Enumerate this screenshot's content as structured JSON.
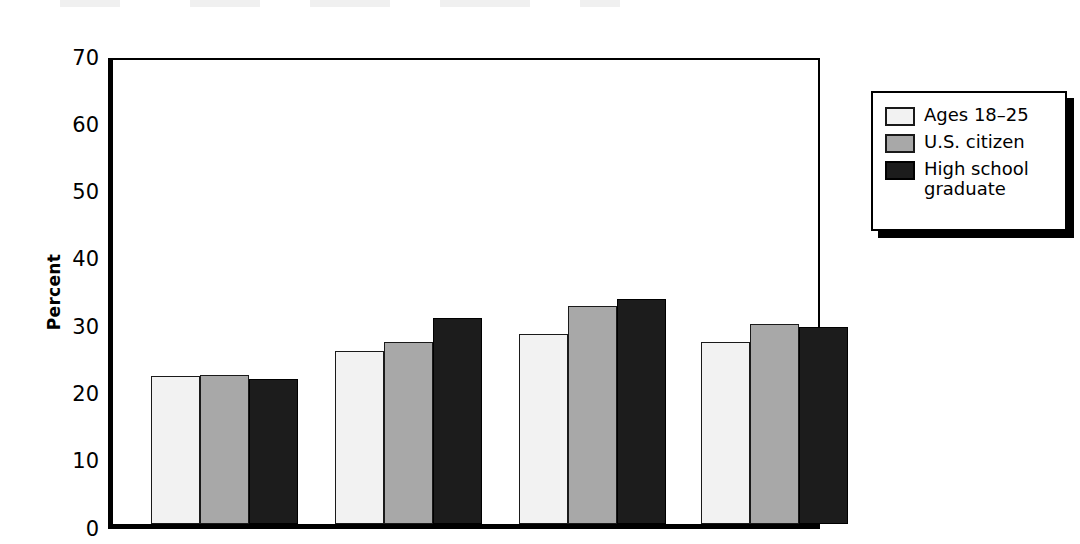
{
  "chart_data": {
    "type": "bar",
    "title": "",
    "xlabel": "",
    "ylabel": "Percent",
    "ylim": [
      0,
      70
    ],
    "yticks": [
      0,
      10,
      20,
      30,
      40,
      50,
      60,
      70
    ],
    "ytick_labels": [
      "0",
      "10",
      "20",
      "30",
      "40",
      "50",
      "60",
      "70"
    ],
    "grid": false,
    "legend_position": "right",
    "categories": [
      "Group 1",
      "Group 2",
      "Group 3",
      "Group 4"
    ],
    "series": [
      {
        "name": "Ages 18–25",
        "color": "#f2f2f2",
        "values": [
          22.0,
          25.7,
          28.3,
          27.1
        ]
      },
      {
        "name": "U.S. citizen",
        "color": "#a8a8a8",
        "values": [
          22.1,
          27.1,
          32.4,
          29.8
        ]
      },
      {
        "name": "High school graduate",
        "color": "#1c1c1c",
        "values": [
          21.5,
          30.6,
          33.5,
          29.3
        ]
      }
    ]
  },
  "axis": {
    "y_title": "Percent",
    "ticks": [
      {
        "value": 70,
        "label": "70"
      },
      {
        "value": 60,
        "label": "60"
      },
      {
        "value": 50,
        "label": "50"
      },
      {
        "value": 40,
        "label": "40"
      },
      {
        "value": 30,
        "label": "30"
      },
      {
        "value": 20,
        "label": "20"
      },
      {
        "value": 10,
        "label": "10"
      },
      {
        "value": 0,
        "label": "0"
      }
    ]
  },
  "legend": {
    "items": [
      {
        "label": "Ages 18–25",
        "swatch": "legend-swatch-light"
      },
      {
        "label": "U.S. citizen",
        "swatch": "legend-swatch-gray"
      },
      {
        "label": "High school\ngraduate",
        "swatch": "legend-swatch-dark"
      }
    ]
  },
  "colors": {
    "series_light": "#f2f2f2",
    "series_gray": "#a8a8a8",
    "series_dark": "#1c1c1c",
    "axis": "#000000",
    "background": "#ffffff"
  }
}
